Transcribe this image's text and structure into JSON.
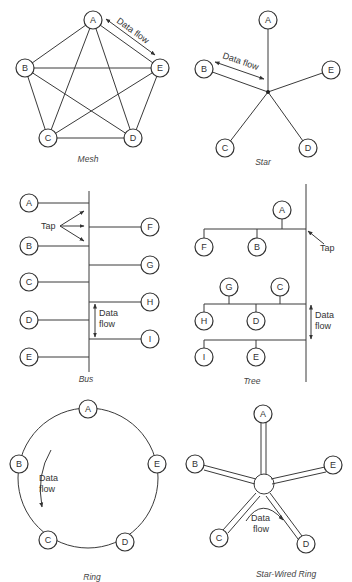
{
  "figure": {
    "panels": [
      {
        "id": "mesh",
        "caption": "Mesh",
        "nodes": [
          "A",
          "B",
          "C",
          "D",
          "E"
        ],
        "annotation": "Data flow"
      },
      {
        "id": "star",
        "caption": "Star",
        "nodes": [
          "A",
          "B",
          "C",
          "D",
          "E"
        ],
        "annotation": "Data flow"
      },
      {
        "id": "bus",
        "caption": "Bus",
        "nodes": [
          "A",
          "B",
          "C",
          "D",
          "E",
          "F",
          "G",
          "H",
          "I"
        ],
        "annotations": [
          "Tap",
          "Data",
          "flow"
        ]
      },
      {
        "id": "tree",
        "caption": "Tree",
        "nodes": [
          "A",
          "F",
          "B",
          "G",
          "C",
          "H",
          "D",
          "I",
          "E"
        ],
        "annotations": [
          "Tap",
          "Data",
          "flow"
        ]
      },
      {
        "id": "ring",
        "caption": "Ring",
        "nodes": [
          "A",
          "B",
          "C",
          "D",
          "E"
        ],
        "annotations": [
          "Data",
          "flow"
        ]
      },
      {
        "id": "star-wired-ring",
        "caption": "Star-Wired Ring",
        "nodes": [
          "A",
          "B",
          "C",
          "D",
          "E"
        ],
        "annotations": [
          "Data",
          "flow"
        ]
      }
    ]
  },
  "labels": {
    "A": "A",
    "B": "B",
    "C": "C",
    "D": "D",
    "E": "E",
    "F": "F",
    "G": "G",
    "H": "H",
    "I": "I",
    "data_flow": "Data flow",
    "data": "Data",
    "flow": "flow",
    "tap": "Tap"
  },
  "captions": {
    "mesh": "Mesh",
    "star": "Star",
    "bus": "Bus",
    "tree": "Tree",
    "ring": "Ring",
    "star_wired_ring": "Star-Wired Ring"
  },
  "colors": {
    "line": "#3a3a3a",
    "background": "#ffffff"
  }
}
